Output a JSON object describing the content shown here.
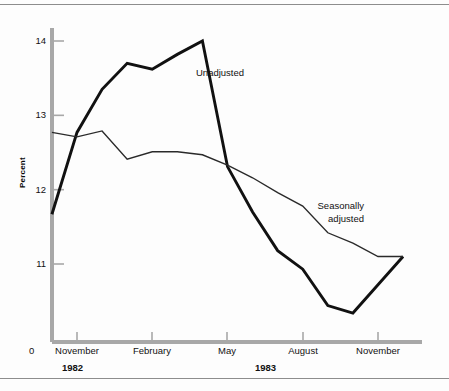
{
  "figure": {
    "background_color": "#fdfdfd",
    "rule_color": "#8d8d8d",
    "axis_color": "#a8a8a8",
    "series_colors": {
      "unadjusted": "#111111",
      "seasonally_adjusted": "#2a2a2a"
    }
  },
  "axes": {
    "y_title": "Percent",
    "origin_label": "0",
    "y_ticks": [
      "11",
      "12",
      "13",
      "14"
    ],
    "x_ticks": [
      "November",
      "February",
      "May",
      "August",
      "November"
    ],
    "years": [
      "1982",
      "1983"
    ]
  },
  "annotations": {
    "unadjusted": "Unadjusted",
    "seasonally_line1": "Seasonally",
    "seasonally_line2": "adjusted"
  },
  "chart_data": {
    "type": "line",
    "title": "",
    "xlabel": "",
    "ylabel": "Percent",
    "ylim": [
      10.2,
      14.2
    ],
    "y_ticks": [
      11,
      12,
      13,
      14
    ],
    "grid": false,
    "legend": "inline-annotations",
    "x": [
      "Oct 1982",
      "Nov 1982",
      "Dec 1982",
      "Jan 1983",
      "Feb 1983",
      "Mar 1983",
      "Apr 1983",
      "May 1983",
      "Jun 1983",
      "Jul 1983",
      "Aug 1983",
      "Sep 1983",
      "Oct 1983",
      "Nov 1983",
      "Dec 1983"
    ],
    "x_tick_labels": [
      "November",
      "February",
      "May",
      "August",
      "November"
    ],
    "x_tick_index": [
      1,
      4,
      7,
      10,
      13
    ],
    "series": [
      {
        "name": "Unadjusted",
        "values": [
          11.67,
          12.77,
          13.35,
          13.7,
          13.62,
          13.82,
          14.0,
          12.31,
          11.7,
          11.18,
          10.93,
          10.44,
          10.34,
          10.72,
          11.1
        ]
      },
      {
        "name": "Seasonally adjusted",
        "values": [
          12.77,
          12.71,
          12.79,
          12.41,
          12.51,
          12.51,
          12.47,
          12.33,
          12.16,
          11.96,
          11.78,
          11.42,
          11.28,
          11.1,
          11.1
        ]
      }
    ]
  }
}
